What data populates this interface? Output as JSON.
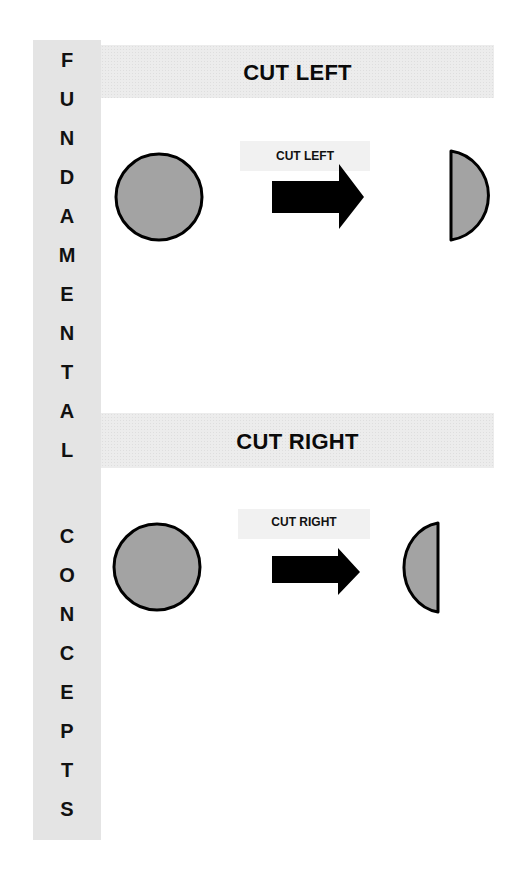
{
  "sidebar": {
    "letters": [
      "F",
      "U",
      "N",
      "D",
      "A",
      "M",
      "E",
      "N",
      "T",
      "A",
      "L",
      "C",
      "O",
      "N",
      "C",
      "E",
      "P",
      "T",
      "S"
    ],
    "words": [
      "FUNDAMENTAL",
      "CONCEPTS"
    ]
  },
  "sections": [
    {
      "title": "CUT LEFT",
      "label": "CUT LEFT",
      "result": "left-half-removed"
    },
    {
      "title": "CUT RIGHT",
      "label": "CUT RIGHT",
      "result": "right-half-removed"
    }
  ],
  "colors": {
    "shape_fill": "#a3a3a3",
    "stroke": "#000000",
    "band": "#ececec",
    "sidebar": "#e4e4e4"
  }
}
